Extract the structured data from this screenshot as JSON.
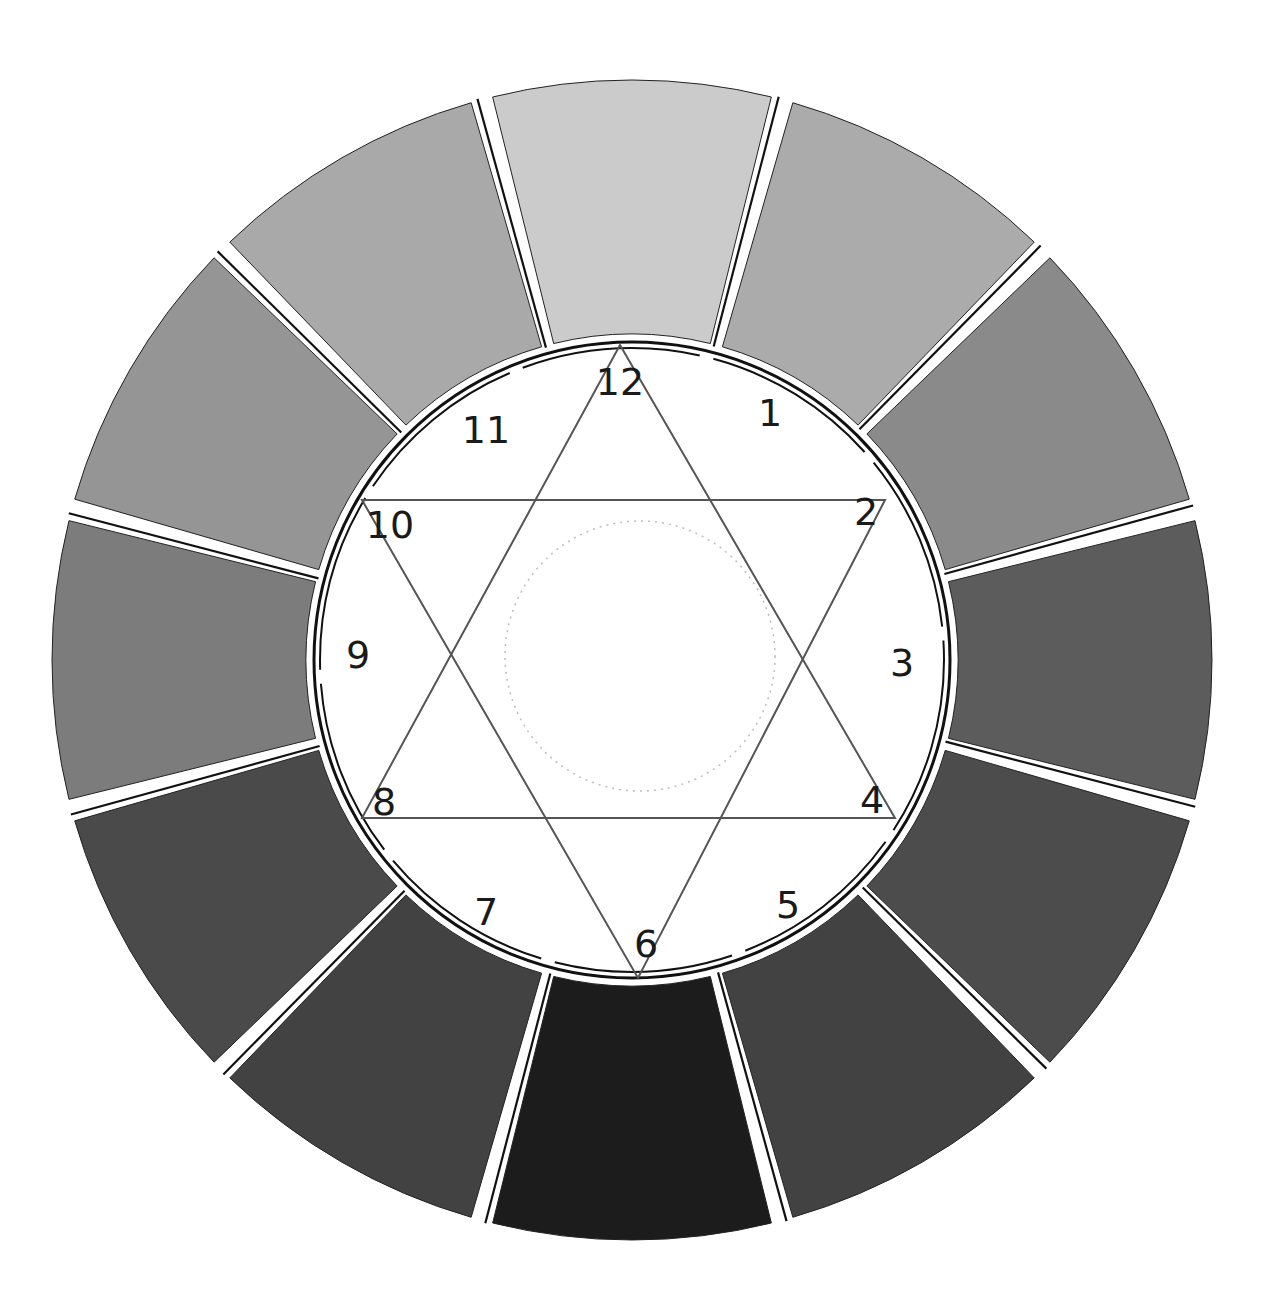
{
  "diagram": {
    "type": "grayscale value wheel with hexagram",
    "center": {
      "x": 632,
      "y": 660
    },
    "outer_radius": 580,
    "inner_radius": 318,
    "gap_color": "#ffffff",
    "divider_color": "#111111",
    "segments": [
      {
        "position": "12",
        "shade": "#cbcbcb"
      },
      {
        "position": "1",
        "shade": "#ababab"
      },
      {
        "position": "2",
        "shade": "#8a8a8a"
      },
      {
        "position": "3",
        "shade": "#5c5c5c"
      },
      {
        "position": "4",
        "shade": "#4c4c4c"
      },
      {
        "position": "5",
        "shade": "#424242"
      },
      {
        "position": "6",
        "shade": "#1c1c1c"
      },
      {
        "position": "7",
        "shade": "#424242"
      },
      {
        "position": "8",
        "shade": "#4a4a4a"
      },
      {
        "position": "9",
        "shade": "#7c7c7c"
      },
      {
        "position": "10",
        "shade": "#959595"
      },
      {
        "position": "11",
        "shade": "#a9a9a9"
      }
    ],
    "labels": [
      {
        "text": "12",
        "x": 620,
        "y": 382
      },
      {
        "text": "1",
        "x": 770,
        "y": 413
      },
      {
        "text": "2",
        "x": 866,
        "y": 512
      },
      {
        "text": "3",
        "x": 902,
        "y": 663
      },
      {
        "text": "4",
        "x": 872,
        "y": 800
      },
      {
        "text": "5",
        "x": 788,
        "y": 905
      },
      {
        "text": "6",
        "x": 646,
        "y": 944
      },
      {
        "text": "7",
        "x": 486,
        "y": 912
      },
      {
        "text": "8",
        "x": 384,
        "y": 802
      },
      {
        "text": "9",
        "x": 358,
        "y": 655
      },
      {
        "text": "10",
        "x": 390,
        "y": 525
      },
      {
        "text": "11",
        "x": 486,
        "y": 430
      }
    ],
    "hexagram": {
      "triangle_up": {
        "vertices": [
          "12",
          "4",
          "8"
        ],
        "points": [
          [
            620,
            345
          ],
          [
            895,
            818
          ],
          [
            362,
            818
          ]
        ]
      },
      "triangle_down": {
        "vertices": [
          "2",
          "6",
          "10"
        ],
        "points": [
          [
            885,
            500
          ],
          [
            638,
            978
          ],
          [
            362,
            500
          ]
        ]
      },
      "line_color": "#555555"
    },
    "center_circle": {
      "radius": 135,
      "style": "faint dotted",
      "color": "#bdbdbd"
    }
  }
}
